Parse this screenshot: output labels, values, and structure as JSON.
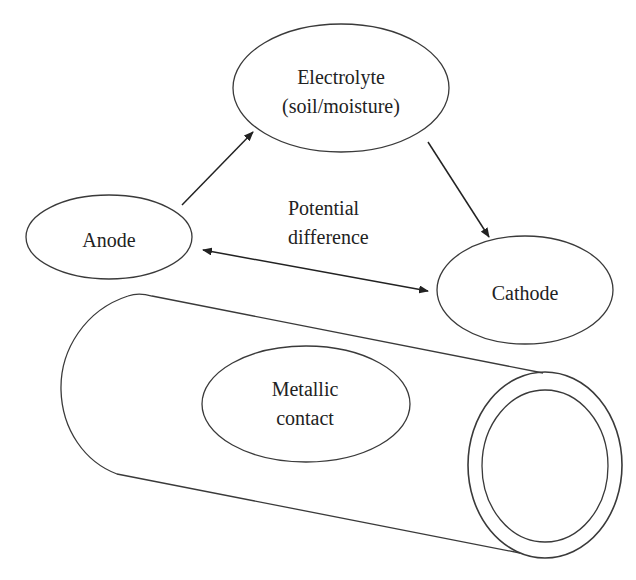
{
  "diagram": {
    "nodes": {
      "electrolyte": {
        "line1": "Electrolyte",
        "line2": "(soil/moisture)"
      },
      "anode": {
        "label": "Anode"
      },
      "cathode": {
        "label": "Cathode"
      },
      "metallic_contact": {
        "line1": "Metallic",
        "line2": "contact"
      }
    },
    "edges": [
      {
        "from": "Anode",
        "to": "Electrolyte (soil/moisture)",
        "type": "single-arrow"
      },
      {
        "from": "Electrolyte (soil/moisture)",
        "to": "Cathode",
        "type": "single-arrow"
      },
      {
        "from": "Anode",
        "to": "Cathode",
        "type": "double-arrow",
        "label": "Potential difference"
      }
    ],
    "edge_label": {
      "line1": "Potential",
      "line2": "difference"
    },
    "colors": {
      "stroke": "#3a3a3a",
      "text": "#222222",
      "background": "#ffffff"
    }
  }
}
